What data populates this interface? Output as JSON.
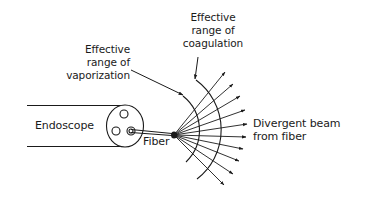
{
  "diagram": {
    "labels": {
      "vaporization": {
        "line1": "Effective",
        "line2": "range of",
        "line3": "vaporization"
      },
      "coagulation": {
        "line1": "Effective",
        "line2": "range of",
        "line3": "coagulation"
      },
      "beam": {
        "line1": "Divergent beam",
        "line2": "from fiber"
      },
      "endoscope": "Endoscope",
      "fiber": "Fiber"
    },
    "colors": {
      "stroke": "#1a1a1a",
      "background": "#ffffff"
    },
    "geometry": {
      "fiber_tip": [
        174,
        135
      ],
      "ray_count": 11
    }
  }
}
